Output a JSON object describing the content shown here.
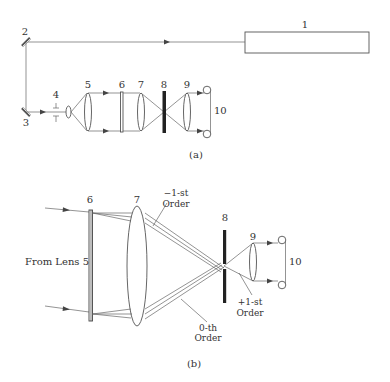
{
  "figure": {
    "panel_a": {
      "caption": "(a)",
      "labels": {
        "laser": "1",
        "mirror_top": "2",
        "mirror_bottom": "3",
        "aperture": "4",
        "collimating_lens": "5",
        "grating": "6",
        "lens": "7",
        "spatial_filter": "8",
        "lens_out": "9",
        "detectors": "10"
      }
    },
    "panel_b": {
      "caption": "(b)",
      "labels": {
        "grating": "6",
        "lens": "7",
        "spatial_filter": "8",
        "lens_out": "9",
        "detectors": "10",
        "input": "From Lens 5",
        "minus_first_line1": "−1-st",
        "minus_first_line2": "Order",
        "plus_first_line1": "+1-st",
        "plus_first_line2": "Order",
        "zeroth_line1": "0-th",
        "zeroth_line2": "Order"
      }
    },
    "colors": {
      "line": "#555555",
      "text": "#333333",
      "filter": "#222222",
      "background": "#ffffff"
    }
  }
}
